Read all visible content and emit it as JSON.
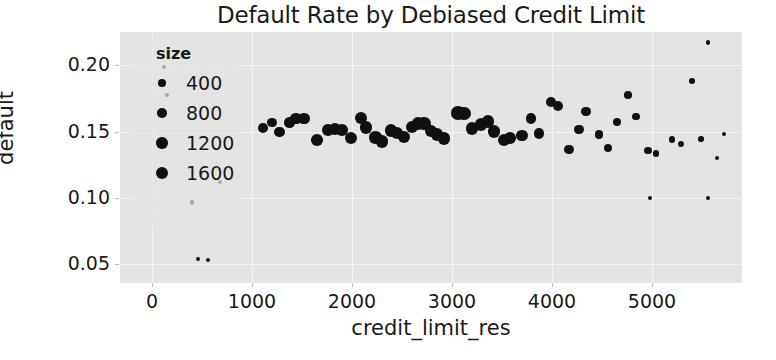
{
  "chart_data": {
    "type": "scatter",
    "title": "Default Rate by Debiased Credit Limit",
    "xlabel": "credit_limit_res",
    "ylabel": "default",
    "xlim": [
      -320,
      5900
    ],
    "ylim": [
      0.036,
      0.225
    ],
    "xticks": [
      0,
      1000,
      2000,
      3000,
      4000,
      5000
    ],
    "xticklabels": [
      "0",
      "1000",
      "2000",
      "3000",
      "4000",
      "5000"
    ],
    "yticks": [
      0.05,
      0.1,
      0.15,
      0.2
    ],
    "yticklabels": [
      "0.05",
      "0.10",
      "0.15",
      "0.20"
    ],
    "grid": true,
    "marker_color": "#111111",
    "background_color": "#e9e9e9",
    "legend": {
      "title": "size",
      "position": "upper-left-inside",
      "entries": [
        {
          "label": "400",
          "value": 400
        },
        {
          "label": "800",
          "value": 800
        },
        {
          "label": "1200",
          "value": 1200
        },
        {
          "label": "1600",
          "value": 1600
        }
      ]
    },
    "size_legend_values": [
      400,
      800,
      1200,
      1600
    ],
    "points": [
      {
        "x": 1110,
        "y": 0.1525,
        "size": 620
      },
      {
        "x": 1200,
        "y": 0.1565,
        "size": 520
      },
      {
        "x": 1275,
        "y": 0.15,
        "size": 700
      },
      {
        "x": 1375,
        "y": 0.157,
        "size": 780
      },
      {
        "x": 1440,
        "y": 0.16,
        "size": 900
      },
      {
        "x": 1520,
        "y": 0.16,
        "size": 900
      },
      {
        "x": 1650,
        "y": 0.1435,
        "size": 1000
      },
      {
        "x": 1760,
        "y": 0.151,
        "size": 1000
      },
      {
        "x": 1830,
        "y": 0.152,
        "size": 1050
      },
      {
        "x": 1900,
        "y": 0.151,
        "size": 1000
      },
      {
        "x": 1990,
        "y": 0.1455,
        "size": 1100
      },
      {
        "x": 2090,
        "y": 0.16,
        "size": 1150
      },
      {
        "x": 2140,
        "y": 0.153,
        "size": 1250
      },
      {
        "x": 2235,
        "y": 0.1455,
        "size": 1150
      },
      {
        "x": 2300,
        "y": 0.1425,
        "size": 1100
      },
      {
        "x": 2390,
        "y": 0.151,
        "size": 1200
      },
      {
        "x": 2450,
        "y": 0.149,
        "size": 1150
      },
      {
        "x": 2520,
        "y": 0.146,
        "size": 1100
      },
      {
        "x": 2600,
        "y": 0.1535,
        "size": 1150
      },
      {
        "x": 2660,
        "y": 0.156,
        "size": 1250
      },
      {
        "x": 2720,
        "y": 0.156,
        "size": 1350
      },
      {
        "x": 2790,
        "y": 0.1505,
        "size": 1250
      },
      {
        "x": 2850,
        "y": 0.148,
        "size": 1200
      },
      {
        "x": 2920,
        "y": 0.145,
        "size": 1250
      },
      {
        "x": 3060,
        "y": 0.164,
        "size": 1400
      },
      {
        "x": 3120,
        "y": 0.1635,
        "size": 1400
      },
      {
        "x": 3200,
        "y": 0.1525,
        "size": 1300
      },
      {
        "x": 3290,
        "y": 0.1555,
        "size": 1250
      },
      {
        "x": 3360,
        "y": 0.1575,
        "size": 1150
      },
      {
        "x": 3420,
        "y": 0.15,
        "size": 1200
      },
      {
        "x": 3520,
        "y": 0.144,
        "size": 1100
      },
      {
        "x": 3580,
        "y": 0.145,
        "size": 1000
      },
      {
        "x": 3700,
        "y": 0.147,
        "size": 900
      },
      {
        "x": 3790,
        "y": 0.16,
        "size": 850
      },
      {
        "x": 3870,
        "y": 0.1485,
        "size": 800
      },
      {
        "x": 3990,
        "y": 0.1725,
        "size": 720
      },
      {
        "x": 4060,
        "y": 0.169,
        "size": 680
      },
      {
        "x": 4170,
        "y": 0.1365,
        "size": 600
      },
      {
        "x": 4270,
        "y": 0.1515,
        "size": 560
      },
      {
        "x": 4340,
        "y": 0.165,
        "size": 520
      },
      {
        "x": 4470,
        "y": 0.148,
        "size": 480
      },
      {
        "x": 4560,
        "y": 0.1375,
        "size": 420
      },
      {
        "x": 4650,
        "y": 0.1575,
        "size": 400
      },
      {
        "x": 4760,
        "y": 0.1775,
        "size": 330
      },
      {
        "x": 4840,
        "y": 0.1615,
        "size": 330
      },
      {
        "x": 4960,
        "y": 0.1355,
        "size": 260
      },
      {
        "x": 5040,
        "y": 0.1335,
        "size": 230
      },
      {
        "x": 5200,
        "y": 0.144,
        "size": 190
      },
      {
        "x": 5290,
        "y": 0.141,
        "size": 170
      },
      {
        "x": 5400,
        "y": 0.188,
        "size": 120
      },
      {
        "x": 5490,
        "y": 0.1445,
        "size": 110
      },
      {
        "x": 5560,
        "y": 0.217,
        "size": 80
      },
      {
        "x": 5560,
        "y": 0.1,
        "size": 70
      },
      {
        "x": 4980,
        "y": 0.1,
        "size": 70
      },
      {
        "x": 400,
        "y": 0.0965,
        "size": 70
      },
      {
        "x": 120,
        "y": 0.1985,
        "size": 60
      },
      {
        "x": 150,
        "y": 0.1775,
        "size": 55
      },
      {
        "x": 460,
        "y": 0.054,
        "size": 60
      },
      {
        "x": 560,
        "y": 0.0535,
        "size": 55
      },
      {
        "x": 680,
        "y": 0.112,
        "size": 55
      },
      {
        "x": 5650,
        "y": 0.13,
        "size": 60
      },
      {
        "x": 5720,
        "y": 0.148,
        "size": 55
      }
    ]
  }
}
